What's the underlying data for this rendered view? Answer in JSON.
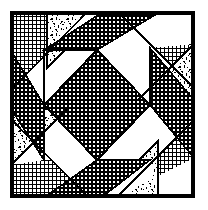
{
  "figure": {
    "canvas": {
      "width": 208,
      "height": 210
    },
    "background_color": "#ffffff",
    "ink_color": "#000000"
  },
  "frame": {
    "name": "block-border",
    "left": 11,
    "top": 12,
    "right": 194,
    "bottom": 197,
    "width": 183,
    "height": 185,
    "stroke_color": "#000000",
    "stroke_width": 3
  },
  "fabrics": [
    {
      "id": "grid",
      "label": "Fine crosshatch grid print",
      "swatch_color": "#3a3a3a",
      "pattern": "crosshatch",
      "cell_px": 4
    },
    {
      "id": "dot",
      "label": "Dense checkerboard dot print",
      "swatch_color": "#2b2b2b",
      "pattern": "checker-dot",
      "cell_px": 4
    },
    {
      "id": "speckle",
      "label": "Scattered leaf speckle print",
      "swatch_color": "#8a8a8a",
      "pattern": "speckle",
      "cell_px": 12
    },
    {
      "id": "plain",
      "label": "Plain white solid",
      "swatch_color": "#ffffff",
      "pattern": "solid",
      "cell_px": 0
    }
  ],
  "center": {
    "name": "center-on-point-square",
    "fabric": "dot",
    "points": "97,50 150,105 97,160 44,105"
  },
  "pieces": [
    {
      "name": "corner-triangle-top-left",
      "fabric": "grid",
      "points": "11,12 87,12 11,90"
    },
    {
      "name": "corner-triangle-top-right",
      "fabric": "grid",
      "points": "118,12 194,12 194,88"
    },
    {
      "name": "corner-triangle-bottom-right",
      "fabric": "grid",
      "points": "194,120 194,197 117,197"
    },
    {
      "name": "corner-triangle-bottom-left",
      "fabric": "grid",
      "points": "11,119 88,197 11,197"
    },
    {
      "name": "speckle-wedge-top-left",
      "fabric": "speckle",
      "points": "47,12 103,12 47,68"
    },
    {
      "name": "speckle-wedge-top-right",
      "fabric": "speckle",
      "points": "194,44 194,100 138,100"
    },
    {
      "name": "speckle-wedge-bottom-right",
      "fabric": "speckle",
      "points": "158,197 102,197 158,141"
    },
    {
      "name": "speckle-wedge-bottom-left",
      "fabric": "speckle",
      "points": "11,165 11,109 67,109"
    },
    {
      "name": "ribbon-arm-top-dot",
      "fabric": "dot",
      "points": "103,12 160,12 97,50 44,50"
    },
    {
      "name": "ribbon-arm-right-dot",
      "fabric": "dot",
      "points": "194,100 194,158 150,105 150,48"
    },
    {
      "name": "ribbon-arm-bottom-dot",
      "fabric": "dot",
      "points": "102,197 45,197 97,160 150,160"
    },
    {
      "name": "ribbon-arm-left-dot",
      "fabric": "dot",
      "points": "11,109 11,51 44,105 44,160"
    },
    {
      "name": "white-ribbon-upper-left",
      "fabric": "plain",
      "points": "11,90 87,12 103,12 11,105"
    },
    {
      "name": "white-ribbon-upper-right",
      "fabric": "plain",
      "points": "118,12 194,12 194,44 150,48"
    },
    {
      "name": "white-ribbon-lower-right",
      "fabric": "plain",
      "points": "194,158 194,197 158,197 150,160"
    },
    {
      "name": "white-ribbon-lower-left",
      "fabric": "plain",
      "points": "11,165 67,109 88,197 45,197"
    }
  ],
  "seam_lines": [
    {
      "name": "seam-top-left-diagonal",
      "x1": 11,
      "y1": 90,
      "x2": 87,
      "y2": 12
    },
    {
      "name": "seam-top-left-speckle",
      "x1": 47,
      "y1": 12,
      "x2": 47,
      "y2": 68
    },
    {
      "name": "seam-top-arm-left",
      "x1": 103,
      "y1": 12,
      "x2": 44,
      "y2": 50
    },
    {
      "name": "seam-top-arm-right",
      "x1": 160,
      "y1": 12,
      "x2": 97,
      "y2": 50
    },
    {
      "name": "seam-top-right-diagonal",
      "x1": 118,
      "y1": 12,
      "x2": 194,
      "y2": 88
    },
    {
      "name": "seam-right-speckle",
      "x1": 194,
      "y1": 44,
      "x2": 138,
      "y2": 100
    },
    {
      "name": "seam-right-arm-top",
      "x1": 194,
      "y1": 100,
      "x2": 150,
      "y2": 48
    },
    {
      "name": "seam-right-arm-bottom",
      "x1": 194,
      "y1": 158,
      "x2": 150,
      "y2": 105
    },
    {
      "name": "seam-bottom-right-diagonal",
      "x1": 194,
      "y1": 120,
      "x2": 117,
      "y2": 197
    },
    {
      "name": "seam-bottom-speckle",
      "x1": 158,
      "y1": 197,
      "x2": 158,
      "y2": 141
    },
    {
      "name": "seam-bottom-arm-right",
      "x1": 102,
      "y1": 197,
      "x2": 150,
      "y2": 160
    },
    {
      "name": "seam-bottom-arm-left",
      "x1": 45,
      "y1": 197,
      "x2": 97,
      "y2": 160
    },
    {
      "name": "seam-bottom-left-diagonal",
      "x1": 11,
      "y1": 119,
      "x2": 88,
      "y2": 197
    },
    {
      "name": "seam-left-speckle",
      "x1": 11,
      "y1": 165,
      "x2": 67,
      "y2": 109
    },
    {
      "name": "seam-left-arm-bottom",
      "x1": 11,
      "y1": 109,
      "x2": 44,
      "y2": 160
    },
    {
      "name": "seam-left-arm-top",
      "x1": 11,
      "y1": 51,
      "x2": 44,
      "y2": 105
    }
  ]
}
